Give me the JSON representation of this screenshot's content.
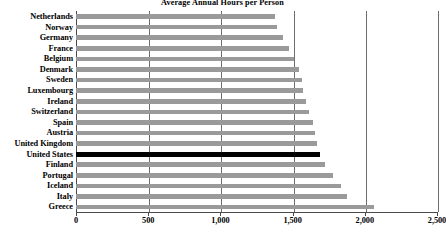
{
  "chart_data": {
    "type": "bar",
    "orientation": "horizontal",
    "title": "Average Annual Hours per Person",
    "xlabel": "",
    "ylabel": "",
    "xlim": [
      0,
      2500
    ],
    "xticks": [
      0,
      500,
      1000,
      1500,
      2000,
      2500
    ],
    "xtick_labels": [
      "0",
      "500",
      "1,000",
      "1,500",
      "2,000",
      "2,500"
    ],
    "grid": true,
    "grid_axis": "x",
    "legend": false,
    "bar_color": "#9a9a9a",
    "highlight_color": "#000000",
    "highlight_category": "United States",
    "categories": [
      "Netherlands",
      "Norway",
      "Germany",
      "France",
      "Belgium",
      "Denmark",
      "Sweden",
      "Luxembourg",
      "Ireland",
      "Switzerland",
      "Spain",
      "Austria",
      "United Kingdom",
      "United States",
      "Finland",
      "Portugal",
      "Iceland",
      "Italy",
      "Greece"
    ],
    "values": [
      1377,
      1392,
      1432,
      1478,
      1510,
      1542,
      1562,
      1570,
      1590,
      1617,
      1640,
      1655,
      1670,
      1689,
      1722,
      1777,
      1832,
      1874,
      2062
    ]
  }
}
